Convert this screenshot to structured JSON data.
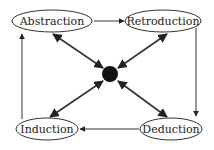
{
  "diagram": {
    "nodes": [
      {
        "id": "abstraction",
        "label": "Abstraction"
      },
      {
        "id": "retroduction",
        "label": "Retroduction"
      },
      {
        "id": "induction",
        "label": "Induction"
      },
      {
        "id": "deduction",
        "label": "Deduction"
      }
    ],
    "center": {
      "id": "hub",
      "label": ""
    },
    "edges": [
      {
        "from": "abstraction",
        "to": "retroduction",
        "type": "directed"
      },
      {
        "from": "retroduction",
        "to": "deduction",
        "type": "directed"
      },
      {
        "from": "deduction",
        "to": "induction",
        "type": "directed"
      },
      {
        "from": "induction",
        "to": "abstraction",
        "type": "directed"
      },
      {
        "from": "hub",
        "to": "abstraction",
        "type": "bidirectional"
      },
      {
        "from": "hub",
        "to": "retroduction",
        "type": "bidirectional"
      },
      {
        "from": "hub",
        "to": "induction",
        "type": "bidirectional"
      },
      {
        "from": "hub",
        "to": "deduction",
        "type": "bidirectional"
      }
    ]
  }
}
